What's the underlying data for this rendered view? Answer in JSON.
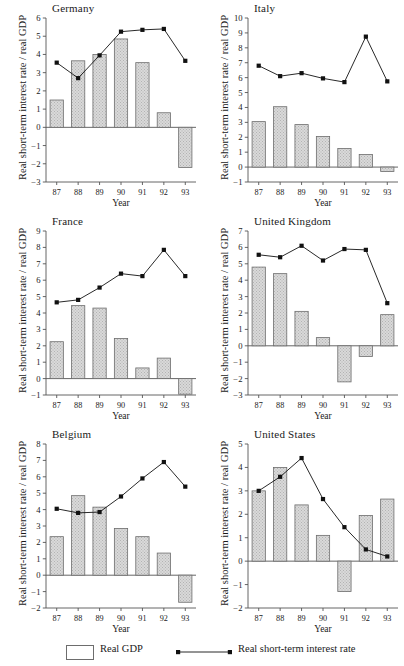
{
  "figure": {
    "xlabel": "Year",
    "ylabel": "Real short-term interest rate / real GDP",
    "years": [
      "87",
      "88",
      "89",
      "90",
      "91",
      "92",
      "93"
    ],
    "legend": {
      "bar_label": "Real GDP",
      "line_label": "Real short-term interest rate",
      "bar_swatch_fill": "#d9d9d9",
      "bar_swatch_stroke": "#6d6d6d",
      "line_color": "#111111"
    },
    "style": {
      "bar_fill": "#d9d9d9",
      "bar_stroke": "#6d6d6d",
      "line_color": "#111111",
      "axis_color": "#555555"
    }
  },
  "chart_data": [
    {
      "type": "bar",
      "title": "Germany",
      "xlabel": "Year",
      "ylabel": "Real short-term interest rate / real GDP",
      "categories": [
        "87",
        "88",
        "89",
        "90",
        "91",
        "92",
        "93"
      ],
      "ylim": [
        -3,
        6
      ],
      "yticks": [
        6,
        5,
        4,
        3,
        2,
        1,
        0,
        -1,
        -2,
        -3
      ],
      "grid": false,
      "series": [
        {
          "name": "Real GDP",
          "type": "bar",
          "values": [
            1.5,
            3.65,
            4.0,
            4.85,
            3.55,
            0.8,
            -2.2
          ]
        },
        {
          "name": "Real short-term interest rate",
          "type": "line",
          "values": [
            3.55,
            2.7,
            3.95,
            5.25,
            5.35,
            5.4,
            3.65
          ]
        }
      ]
    },
    {
      "type": "bar",
      "title": "Italy",
      "xlabel": "Year",
      "ylabel": "Real short-term interest rate / real GDP",
      "categories": [
        "87",
        "88",
        "89",
        "90",
        "91",
        "92",
        "93"
      ],
      "ylim": [
        -1,
        10
      ],
      "yticks": [
        10,
        9,
        8,
        7,
        6,
        5,
        4,
        3,
        2,
        1,
        0,
        -1
      ],
      "grid": false,
      "series": [
        {
          "name": "Real GDP",
          "type": "bar",
          "values": [
            3.05,
            4.05,
            2.85,
            2.05,
            1.25,
            0.85,
            -0.3
          ]
        },
        {
          "name": "Real short-term interest rate",
          "type": "line",
          "values": [
            6.8,
            6.1,
            6.3,
            5.95,
            5.7,
            8.75,
            5.75
          ]
        }
      ]
    },
    {
      "type": "bar",
      "title": "France",
      "xlabel": "Year",
      "ylabel": "Real short-term interest rate / real GDP",
      "categories": [
        "87",
        "88",
        "89",
        "90",
        "91",
        "92",
        "93"
      ],
      "ylim": [
        -1,
        9
      ],
      "yticks": [
        9,
        8,
        7,
        6,
        5,
        4,
        3,
        2,
        1,
        0,
        -1
      ],
      "grid": false,
      "series": [
        {
          "name": "Real GDP",
          "type": "bar",
          "values": [
            2.25,
            4.45,
            4.3,
            2.45,
            0.65,
            1.25,
            -0.95
          ]
        },
        {
          "name": "Real short-term interest rate",
          "type": "line",
          "values": [
            4.65,
            4.8,
            5.55,
            6.4,
            6.25,
            7.85,
            6.25
          ]
        }
      ]
    },
    {
      "type": "bar",
      "title": "United Kingdom",
      "xlabel": "Year",
      "ylabel": "Real short-term interest rate / real GDP",
      "categories": [
        "87",
        "88",
        "89",
        "90",
        "91",
        "92",
        "93"
      ],
      "ylim": [
        -3,
        7
      ],
      "yticks": [
        7,
        6,
        5,
        4,
        3,
        2,
        1,
        0,
        -1,
        -2,
        -3
      ],
      "grid": false,
      "series": [
        {
          "name": "Real GDP",
          "type": "bar",
          "values": [
            4.8,
            4.4,
            2.1,
            0.5,
            -2.2,
            -0.65,
            1.9
          ]
        },
        {
          "name": "Real short-term interest rate",
          "type": "line",
          "values": [
            5.55,
            5.4,
            6.1,
            5.2,
            5.9,
            5.85,
            2.6
          ]
        }
      ]
    },
    {
      "type": "bar",
      "title": "Belgium",
      "xlabel": "Year",
      "ylabel": "Real short-term interest rate / real GDP",
      "categories": [
        "87",
        "88",
        "89",
        "90",
        "91",
        "92",
        "93"
      ],
      "ylim": [
        -2,
        8
      ],
      "yticks": [
        8,
        7,
        6,
        5,
        4,
        3,
        2,
        1,
        0,
        -1,
        -2
      ],
      "grid": false,
      "series": [
        {
          "name": "Real GDP",
          "type": "bar",
          "values": [
            2.35,
            4.85,
            4.15,
            2.85,
            2.35,
            1.35,
            -1.65
          ]
        },
        {
          "name": "Real short-term interest rate",
          "type": "line",
          "values": [
            4.05,
            3.8,
            3.85,
            4.8,
            5.9,
            6.9,
            5.4
          ]
        }
      ]
    },
    {
      "type": "bar",
      "title": "United States",
      "xlabel": "Year",
      "ylabel": "Real short-term interest rate / real GDP",
      "categories": [
        "87",
        "88",
        "89",
        "90",
        "91",
        "92",
        "93"
      ],
      "ylim": [
        -2,
        5
      ],
      "yticks": [
        5,
        4,
        3,
        2,
        1,
        0,
        -1,
        -2
      ],
      "grid": false,
      "series": [
        {
          "name": "Real GDP",
          "type": "bar",
          "values": [
            3.0,
            4.0,
            2.4,
            1.1,
            -1.3,
            1.95,
            2.65
          ]
        },
        {
          "name": "Real short-term interest rate",
          "type": "line",
          "values": [
            3.0,
            3.6,
            4.4,
            2.65,
            1.45,
            0.5,
            0.2
          ]
        }
      ]
    }
  ]
}
